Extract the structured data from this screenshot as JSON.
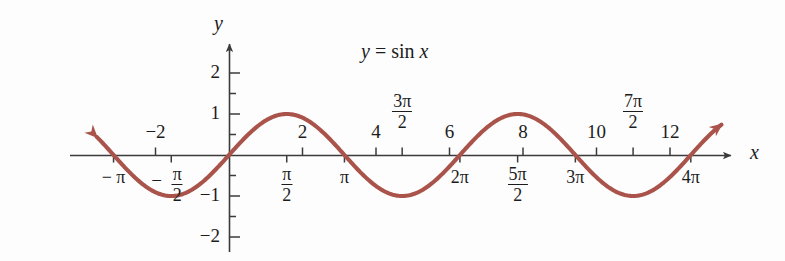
{
  "figure": {
    "background": "#fdfdfd",
    "width": 785,
    "height": 261
  },
  "curve_label": {
    "lhs": "y",
    "equals": "=",
    "fn": "sin",
    "arg": "x",
    "color": "#b0574a"
  },
  "axes": {
    "x_name": "x",
    "y_name": "y",
    "axis_color": "#3b3b3b",
    "origin_px": {
      "x": 229,
      "y": 155
    },
    "x_unit_px": 36.75,
    "y_unit_px": 41.0,
    "x_axis_arrow_tip_px": 737,
    "y_axis_arrow_tip_px": 38
  },
  "y_ticks": [
    {
      "value": 2,
      "label": "2"
    },
    {
      "value": 1,
      "label": "1"
    },
    {
      "value": -1,
      "label": "−1"
    },
    {
      "value": -2,
      "label": "−2"
    }
  ],
  "y_minor_ticks": [
    1.5,
    0.5,
    -0.5,
    -1.5
  ],
  "x_ticks_integer": [
    {
      "value": -2,
      "label": "−2"
    },
    {
      "value": 2,
      "label": "2"
    },
    {
      "value": 4,
      "label": "4"
    },
    {
      "value": 6,
      "label": "6"
    },
    {
      "value": 8,
      "label": "8"
    },
    {
      "value": 10,
      "label": "10"
    },
    {
      "value": 12,
      "label": "12"
    }
  ],
  "x_ticks_pi_below": [
    {
      "value": -3.14159,
      "label": "− π",
      "kind": "plain"
    },
    {
      "value": -1.5708,
      "num": "π",
      "den": "2",
      "neg": true,
      "kind": "fraction"
    },
    {
      "value": 1.5708,
      "num": "π",
      "den": "2",
      "neg": false,
      "kind": "fraction"
    },
    {
      "value": 3.14159,
      "label": "π",
      "kind": "plain"
    },
    {
      "value": 6.28319,
      "label": "2π",
      "kind": "plain"
    },
    {
      "value": 7.85398,
      "num": "5π",
      "den": "2",
      "neg": false,
      "kind": "fraction"
    },
    {
      "value": 9.42478,
      "label": "3π",
      "kind": "plain"
    },
    {
      "value": 12.5664,
      "label": "4π",
      "kind": "plain"
    }
  ],
  "x_ticks_pi_above": [
    {
      "value": 4.71239,
      "num": "3π",
      "den": "2"
    },
    {
      "value": 10.9956,
      "num": "7π",
      "den": "2"
    }
  ],
  "chart_data": {
    "type": "line",
    "title": "y = sin x",
    "xlabel": "x",
    "ylabel": "y",
    "function": "sin",
    "amplitude": 1,
    "period": 6.28319,
    "xlim": [
      -3.6,
      13.4
    ],
    "ylim": [
      -2.6,
      2.6
    ],
    "grid": false,
    "legend": "none",
    "curve_color": "#a9534a",
    "curve_width_px": 4,
    "arrowheads": [
      "start",
      "end"
    ],
    "x": [
      -3.6,
      -3.2,
      -2.8,
      -2.4,
      -2.0,
      -1.6,
      -1.2,
      -0.8,
      -0.4,
      0.0,
      0.4,
      0.8,
      1.2,
      1.6,
      2.0,
      2.4,
      2.8,
      3.2,
      3.6,
      4.0,
      4.4,
      4.8,
      5.2,
      5.6,
      6.0,
      6.4,
      6.8,
      7.2,
      7.6,
      8.0,
      8.4,
      8.8,
      9.2,
      9.6,
      10.0,
      10.4,
      10.8,
      11.2,
      11.6,
      12.0,
      12.4,
      12.8
    ],
    "y": [
      0.4425,
      0.0584,
      -0.335,
      -0.6755,
      -0.9093,
      -0.9996,
      -0.932,
      -0.7174,
      -0.3894,
      0.0,
      0.3894,
      0.7174,
      0.932,
      0.9996,
      0.9093,
      0.6755,
      0.335,
      -0.0584,
      -0.4425,
      -0.7568,
      -0.9516,
      -0.9962,
      -0.8835,
      -0.6313,
      -0.2794,
      0.1165,
      0.4941,
      0.7937,
      0.9679,
      0.9894,
      0.8546,
      0.5849,
      0.2229,
      -0.1743,
      -0.544,
      -0.8268,
      -0.9757,
      -0.9759,
      -0.8276,
      -0.5366,
      -0.1865,
      0.2151
    ],
    "tick_labels_x_integer": [
      "−2",
      "2",
      "4",
      "6",
      "8",
      "10",
      "12"
    ],
    "tick_labels_x_pi": [
      "−π",
      "−π/2",
      "π/2",
      "π",
      "3π/2",
      "2π",
      "5π/2",
      "3π",
      "7π/2",
      "4π"
    ],
    "tick_labels_y": [
      "2",
      "1",
      "−1",
      "−2"
    ]
  }
}
